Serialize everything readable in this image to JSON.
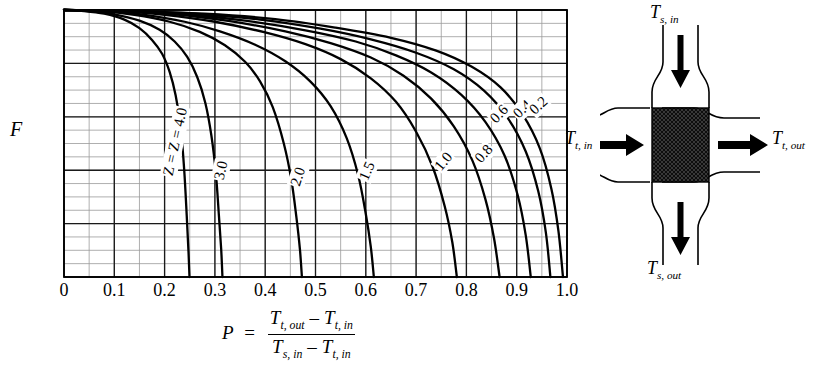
{
  "chart_data": {
    "type": "line",
    "title": "",
    "xlabel": "P",
    "ylabel": "F",
    "xlim": [
      0.0,
      1.0
    ],
    "ylim": [
      0.5,
      1.0
    ],
    "xticks": [
      "0",
      "0.1",
      "0.2",
      "0.3",
      "0.4",
      "0.5",
      "0.6",
      "0.7",
      "0.8",
      "0.9",
      "1.0"
    ],
    "yticks": [
      "0.5",
      "0.6",
      "0.7",
      "0.8",
      "0.9",
      "1.0"
    ],
    "xtick_values": [
      0.0,
      0.1,
      0.2,
      0.3,
      0.4,
      0.5,
      0.6,
      0.7,
      0.8,
      0.9,
      1.0
    ],
    "ytick_values": [
      0.5,
      0.6,
      0.7,
      0.8,
      0.9,
      1.0
    ],
    "minor_x_step": 0.05,
    "minor_y_step": 0.025,
    "grid": true,
    "legend": "none",
    "series_label_prefix": "Z =",
    "series": [
      {
        "name": "4.0",
        "label": "Z = 4.0",
        "x": [
          0.0,
          0.04,
          0.08,
          0.12,
          0.15,
          0.175,
          0.195,
          0.21,
          0.222,
          0.232,
          0.239,
          0.244,
          0.2475,
          0.2495
        ],
        "y": [
          1.0,
          0.998,
          0.993,
          0.982,
          0.966,
          0.944,
          0.918,
          0.884,
          0.84,
          0.78,
          0.7,
          0.615,
          0.548,
          0.5
        ]
      },
      {
        "name": "3.0",
        "label": "3.0",
        "x": [
          0.0,
          0.05,
          0.1,
          0.15,
          0.19,
          0.22,
          0.245,
          0.265,
          0.281,
          0.293,
          0.302,
          0.308,
          0.3125,
          0.315
        ],
        "y": [
          1.0,
          0.998,
          0.992,
          0.98,
          0.963,
          0.941,
          0.912,
          0.874,
          0.826,
          0.765,
          0.693,
          0.615,
          0.552,
          0.5
        ]
      },
      {
        "name": "2.0",
        "label": "2.0",
        "x": [
          0.0,
          0.07,
          0.14,
          0.21,
          0.27,
          0.32,
          0.36,
          0.39,
          0.415,
          0.437,
          0.452,
          0.462,
          0.469,
          0.473
        ],
        "y": [
          1.0,
          0.998,
          0.991,
          0.978,
          0.959,
          0.934,
          0.903,
          0.866,
          0.818,
          0.75,
          0.682,
          0.612,
          0.552,
          0.5
        ]
      },
      {
        "name": "1.5",
        "label": "1.5",
        "x": [
          0.0,
          0.08,
          0.16,
          0.24,
          0.31,
          0.38,
          0.44,
          0.49,
          0.53,
          0.562,
          0.585,
          0.6,
          0.61,
          0.616
        ],
        "y": [
          1.0,
          0.998,
          0.991,
          0.978,
          0.96,
          0.935,
          0.904,
          0.866,
          0.82,
          0.76,
          0.69,
          0.618,
          0.556,
          0.5
        ]
      },
      {
        "name": "1.0",
        "label": "1.0",
        "x": [
          0.0,
          0.1,
          0.2,
          0.3,
          0.4,
          0.48,
          0.55,
          0.61,
          0.66,
          0.7,
          0.733,
          0.757,
          0.772,
          0.781
        ],
        "y": [
          1.0,
          0.998,
          0.991,
          0.978,
          0.958,
          0.936,
          0.908,
          0.872,
          0.828,
          0.772,
          0.706,
          0.632,
          0.565,
          0.5
        ]
      },
      {
        "name": "0.8",
        "label": "0.8",
        "x": [
          0.0,
          0.11,
          0.22,
          0.33,
          0.44,
          0.53,
          0.61,
          0.675,
          0.73,
          0.775,
          0.812,
          0.838,
          0.855,
          0.866
        ],
        "y": [
          1.0,
          0.998,
          0.992,
          0.979,
          0.96,
          0.938,
          0.911,
          0.877,
          0.834,
          0.782,
          0.718,
          0.645,
          0.572,
          0.5
        ]
      },
      {
        "name": "0.6",
        "label": "0.6",
        "x": [
          0.0,
          0.12,
          0.24,
          0.36,
          0.48,
          0.58,
          0.66,
          0.73,
          0.79,
          0.838,
          0.876,
          0.902,
          0.918,
          0.928
        ],
        "y": [
          1.0,
          0.998,
          0.992,
          0.98,
          0.962,
          0.941,
          0.915,
          0.883,
          0.841,
          0.79,
          0.727,
          0.653,
          0.578,
          0.5
        ]
      },
      {
        "name": "0.4",
        "label": "0.4",
        "x": [
          0.0,
          0.13,
          0.26,
          0.39,
          0.51,
          0.61,
          0.7,
          0.775,
          0.835,
          0.882,
          0.918,
          0.943,
          0.958,
          0.967
        ],
        "y": [
          1.0,
          0.998,
          0.993,
          0.982,
          0.965,
          0.945,
          0.92,
          0.889,
          0.849,
          0.798,
          0.735,
          0.66,
          0.583,
          0.5
        ]
      },
      {
        "name": "0.2",
        "label": "0.2",
        "x": [
          0.0,
          0.14,
          0.28,
          0.42,
          0.54,
          0.65,
          0.74,
          0.81,
          0.868,
          0.912,
          0.946,
          0.969,
          0.983,
          0.992
        ],
        "y": [
          1.0,
          0.998,
          0.993,
          0.983,
          0.967,
          0.948,
          0.924,
          0.894,
          0.855,
          0.804,
          0.741,
          0.665,
          0.586,
          0.5
        ]
      }
    ]
  },
  "axes": {
    "y_axis_label": "F",
    "x_axis_symbol": "P"
  },
  "formula": {
    "lhs": "P",
    "equals": "=",
    "numerator_left_var": "T",
    "numerator_left_sub": "t, out",
    "numerator_minus": "–",
    "numerator_right_var": "T",
    "numerator_right_sub": "t, in",
    "denominator_left_var": "T",
    "denominator_left_sub": "s, in",
    "denominator_minus": "–",
    "denominator_right_var": "T",
    "denominator_right_sub": "t, in",
    "plain": "P = (T t,out - T t,in) / (T s,in - T t,in)"
  },
  "diagram": {
    "name": "crossflow-heat-exchanger",
    "labels": {
      "shell_in_var": "T",
      "shell_in_sub": "s, in",
      "shell_out_var": "T",
      "shell_out_sub": "s, out",
      "tube_in_var": "T",
      "tube_in_sub": "t, in",
      "tube_out_var": "T",
      "tube_out_sub": "t, out"
    },
    "core_fill": "#111111",
    "line_color": "#000000"
  },
  "colors": {
    "ink": "#000000",
    "grid_major": "#1a1a1a",
    "grid_minor": "#9a9a9a",
    "background": "#ffffff",
    "curve": "#000000"
  }
}
